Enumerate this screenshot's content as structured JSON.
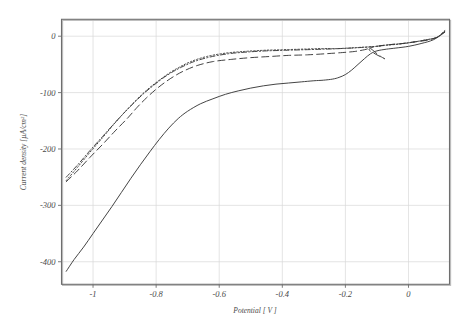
{
  "chart_data": {
    "type": "line",
    "title": "",
    "subtitle": "",
    "xlabel": "Potential [ V ]",
    "ylabel": "Current density  [µA/cm²]",
    "xlim": [
      -1.1,
      0.13
    ],
    "ylim": [
      -440,
      30
    ],
    "xticks": [
      -1,
      -0.8,
      -0.6,
      -0.4,
      -0.2,
      0
    ],
    "xticklabels": [
      "-1",
      "-0.8",
      "-0.6",
      "-0.4",
      "-0.2",
      "0"
    ],
    "yticks": [
      0,
      -100,
      -200,
      -300,
      -400
    ],
    "yticklabels": [
      "0",
      "-100",
      "-200",
      "-300",
      "-400"
    ],
    "grid": true,
    "legend": "none",
    "annotations": [
      "Cathodic polarization curves; all four traces converge near -0.12 V",
      "Solid trace shows a diffusion-limited plateau near -75 µA/cm² between -0.7 V and -0.25 V",
      "Dashed trace forms a small hysteresis loop between -0.14 V and -0.06 V"
    ],
    "series": [
      {
        "name": "solid",
        "style": "solid",
        "x": [
          -1.085,
          -1.06,
          -1.03,
          -1.0,
          -0.97,
          -0.94,
          -0.91,
          -0.88,
          -0.85,
          -0.82,
          -0.79,
          -0.76,
          -0.73,
          -0.7,
          -0.66,
          -0.62,
          -0.58,
          -0.54,
          -0.5,
          -0.46,
          -0.42,
          -0.38,
          -0.34,
          -0.3,
          -0.27,
          -0.24,
          -0.22,
          -0.2,
          -0.18,
          -0.16,
          -0.14,
          -0.12,
          -0.1,
          -0.07,
          -0.04,
          0.0,
          0.04,
          0.08,
          0.115
        ],
        "y": [
          -417,
          -396,
          -374,
          -350,
          -326,
          -302,
          -277,
          -252,
          -228,
          -205,
          -183,
          -163,
          -146,
          -133,
          -120,
          -111,
          -103,
          -97,
          -92,
          -88,
          -85,
          -83,
          -81,
          -79,
          -78,
          -76,
          -73,
          -68,
          -60,
          -50,
          -40,
          -31,
          -26,
          -23,
          -21,
          -18,
          -13,
          -6,
          7
        ]
      },
      {
        "name": "long-dash",
        "style": "dash",
        "x": [
          -1.085,
          -1.05,
          -1.01,
          -0.97,
          -0.93,
          -0.89,
          -0.86,
          -0.83,
          -0.8,
          -0.77,
          -0.74,
          -0.71,
          -0.67,
          -0.62,
          -0.56,
          -0.5,
          -0.44,
          -0.38,
          -0.32,
          -0.26,
          -0.21,
          -0.17,
          -0.14,
          -0.125,
          -0.115,
          -0.1,
          -0.085,
          -0.075,
          -0.09,
          -0.11,
          -0.125,
          -0.115,
          -0.09,
          -0.06,
          -0.02,
          0.02,
          0.06,
          0.09,
          0.115
        ],
        "y": [
          -258,
          -239,
          -215,
          -192,
          -168,
          -145,
          -126,
          -109,
          -94,
          -81,
          -70,
          -61,
          -52,
          -45,
          -41,
          -38,
          -36,
          -34,
          -33,
          -31,
          -29,
          -27,
          -24,
          -22,
          -24,
          -31,
          -37,
          -40,
          -36,
          -30,
          -24,
          -20,
          -17,
          -15,
          -13,
          -10,
          -7,
          -2,
          8
        ]
      },
      {
        "name": "dash-dot",
        "style": "dashdot",
        "x": [
          -1.085,
          -1.05,
          -1.01,
          -0.97,
          -0.93,
          -0.9,
          -0.87,
          -0.84,
          -0.81,
          -0.78,
          -0.75,
          -0.72,
          -0.68,
          -0.63,
          -0.57,
          -0.51,
          -0.45,
          -0.39,
          -0.33,
          -0.27,
          -0.22,
          -0.18,
          -0.15,
          -0.12,
          -0.09,
          -0.06,
          -0.02,
          0.02,
          0.06,
          0.09,
          0.115
        ],
        "y": [
          -250,
          -229,
          -203,
          -178,
          -153,
          -135,
          -118,
          -102,
          -88,
          -75,
          -64,
          -55,
          -45,
          -37,
          -31,
          -28,
          -26,
          -25,
          -24,
          -23,
          -22,
          -21,
          -20,
          -19,
          -17,
          -15,
          -13,
          -10,
          -6,
          -2,
          9
        ]
      },
      {
        "name": "dotted",
        "style": "dot",
        "x": [
          -1.085,
          -1.05,
          -1.01,
          -0.97,
          -0.94,
          -0.91,
          -0.88,
          -0.85,
          -0.82,
          -0.79,
          -0.76,
          -0.73,
          -0.69,
          -0.64,
          -0.58,
          -0.52,
          -0.46,
          -0.4,
          -0.34,
          -0.28,
          -0.23,
          -0.19,
          -0.16,
          -0.13,
          -0.1,
          -0.07,
          -0.03,
          0.01,
          0.05,
          0.09,
          0.115
        ],
        "y": [
          -256,
          -233,
          -206,
          -180,
          -160,
          -141,
          -123,
          -106,
          -91,
          -78,
          -66,
          -56,
          -45,
          -36,
          -30,
          -27,
          -25,
          -24,
          -23,
          -22,
          -22,
          -21,
          -20,
          -19,
          -18,
          -16,
          -14,
          -11,
          -7,
          -2,
          10
        ]
      }
    ]
  },
  "axes": {
    "x_axis_title": "Potential [ V ]",
    "y_axis_title": "Current density  [µA/cm²]"
  },
  "style": {
    "background": "#ffffff",
    "frame_color": "#6e6e6e",
    "grid_color": "#d8d8d8",
    "trace_color": "#3a3a3a",
    "text_color": "#4a4a4a"
  }
}
